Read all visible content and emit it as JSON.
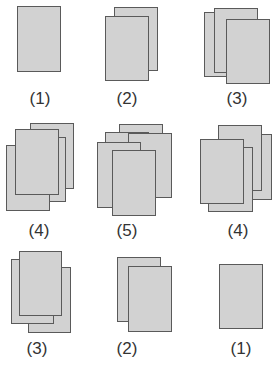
{
  "colors": {
    "sheet_fill": "#d2d2d2",
    "sheet_border": "#5a5a5a",
    "label": "#333333"
  },
  "figures": [
    {
      "id": "r1c1",
      "label": "(1)",
      "label_pos": [
        20,
        90
      ],
      "sheets": [
        [
          17,
          6,
          44,
          66
        ]
      ]
    },
    {
      "id": "r1c2",
      "label": "(2)",
      "label_pos": [
        107,
        90
      ],
      "sheets": [
        [
          114,
          7,
          44,
          64
        ],
        [
          105,
          16,
          44,
          65
        ]
      ]
    },
    {
      "id": "r1c3",
      "label": "(3)",
      "label_pos": [
        217,
        90
      ],
      "sheets": [
        [
          204,
          12,
          41,
          65
        ],
        [
          214,
          8,
          44,
          65
        ],
        [
          226,
          19,
          44,
          65
        ]
      ]
    },
    {
      "id": "r2c1",
      "label": "(4)",
      "label_pos": [
        19,
        222
      ],
      "sheets": [
        [
          30,
          123,
          44,
          66
        ],
        [
          22,
          137,
          44,
          65
        ],
        [
          6,
          145,
          44,
          66
        ],
        [
          15,
          129,
          44,
          66
        ]
      ]
    },
    {
      "id": "r2c2",
      "label": "(5)",
      "label_pos": [
        107,
        222
      ],
      "sheets": [
        [
          119,
          124,
          44,
          66
        ],
        [
          105,
          132,
          44,
          66
        ],
        [
          128,
          133,
          44,
          65
        ],
        [
          97,
          142,
          44,
          66
        ],
        [
          112,
          150,
          44,
          66
        ]
      ]
    },
    {
      "id": "r2c3",
      "label": "(4)",
      "label_pos": [
        218,
        222
      ],
      "sheets": [
        [
          226,
          134,
          46,
          66
        ],
        [
          218,
          125,
          44,
          66
        ],
        [
          208,
          147,
          45,
          65
        ],
        [
          200,
          139,
          44,
          65
        ]
      ]
    },
    {
      "id": "r3c1",
      "label": "(3)",
      "label_pos": [
        17,
        340
      ],
      "sheets": [
        [
          28,
          267,
          43,
          66
        ],
        [
          11,
          259,
          43,
          65
        ],
        [
          19,
          251,
          43,
          65
        ]
      ]
    },
    {
      "id": "r3c2",
      "label": "(2)",
      "label_pos": [
        107,
        340
      ],
      "sheets": [
        [
          117,
          257,
          44,
          65
        ],
        [
          128,
          266,
          44,
          66
        ]
      ]
    },
    {
      "id": "r3c3",
      "label": "(1)",
      "label_pos": [
        221,
        340
      ],
      "sheets": [
        [
          219,
          264,
          44,
          65
        ]
      ]
    }
  ]
}
